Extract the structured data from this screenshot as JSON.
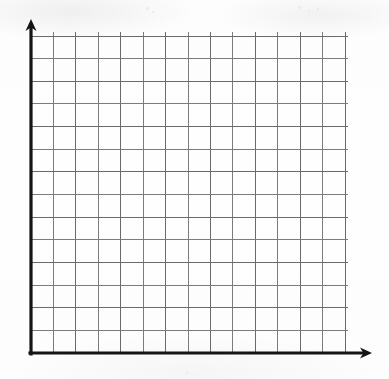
{
  "page": {
    "width": 389,
    "height": 379,
    "background_color": "#fdfdfd"
  },
  "colors": {
    "paper": "#fdfdfd",
    "gridline": "#6a6a6a",
    "axis": "#151515",
    "speck": "#e9e9ec"
  },
  "chart_data": {
    "type": "scatter",
    "title": "",
    "subtitle": "",
    "xlabel": "",
    "ylabel": "",
    "x": [],
    "values": [],
    "series": [],
    "categories": [],
    "annotations": [],
    "legend": [],
    "legend_position": "none",
    "grid": true,
    "grid_columns": 14,
    "grid_rows": 14,
    "xlim": [
      0,
      14
    ],
    "ylim": [
      0,
      14
    ],
    "xticks": [],
    "yticks": [],
    "xtick_labels": [],
    "ytick_labels": [],
    "note": "Empty grid template - no data series are plotted."
  },
  "axes": {
    "y_axis": {
      "name": "vertical axis",
      "x": 31,
      "top": 25,
      "bottom": 354,
      "arrow": "up",
      "label": ""
    },
    "x_axis": {
      "name": "horizontal axis",
      "y": 353,
      "left": 30,
      "right": 365,
      "arrow": "right",
      "label": ""
    }
  },
  "grid": {
    "origin_x": 31,
    "origin_y": 353,
    "right_edge": 345,
    "top_edge": 36,
    "cell_width": 22.43,
    "cell_height": 22.64,
    "columns": 14,
    "rows": 14,
    "vertical_overshoot": 4,
    "horizontal_overshoot": 3
  },
  "artifacts": [
    {
      "x": 146,
      "y": 7,
      "size": 3
    },
    {
      "x": 152,
      "y": 11,
      "size": 2
    },
    {
      "x": 298,
      "y": 6,
      "size": 3
    },
    {
      "x": 308,
      "y": 10,
      "size": 2
    },
    {
      "x": 317,
      "y": 8,
      "size": 2
    },
    {
      "x": 186,
      "y": 372,
      "size": 2
    }
  ]
}
